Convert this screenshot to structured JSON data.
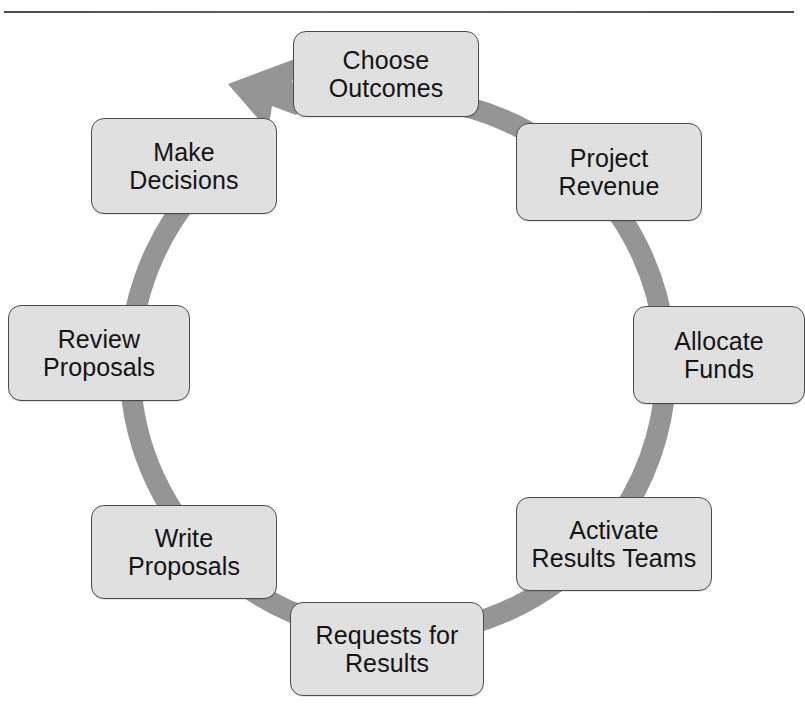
{
  "page": {
    "caption_remnant": "Figure 2. The Budgeting-for-Outcomes Cycle",
    "rule": "horizontal-rule"
  },
  "diagram": {
    "type": "cycle",
    "direction": "clockwise",
    "ring_color": "#9a9a9a",
    "node_fill": "#e3e3e3",
    "node_border": "#4b4b4b",
    "text_color": "#141414",
    "arrow": {
      "name": "clockwise-arrowhead",
      "points_to": "Choose Outcomes",
      "position": "upper-left"
    },
    "nodes": [
      {
        "id": "choose-outcomes",
        "label": "Choose\nOutcomes",
        "order": 1,
        "angle_deg": 0
      },
      {
        "id": "project-revenue",
        "label": "Project\nRevenue",
        "order": 2,
        "angle_deg": 45
      },
      {
        "id": "allocate-funds",
        "label": "Allocate\nFunds",
        "order": 3,
        "angle_deg": 90
      },
      {
        "id": "activate-results",
        "label": "Activate\nResults Teams",
        "order": 4,
        "angle_deg": 135
      },
      {
        "id": "requests-results",
        "label": "Requests for\nResults",
        "order": 5,
        "angle_deg": 180
      },
      {
        "id": "write-proposals",
        "label": "Write\nProposals",
        "order": 6,
        "angle_deg": 225
      },
      {
        "id": "review-proposals",
        "label": "Review\nProposals",
        "order": 7,
        "angle_deg": 270
      },
      {
        "id": "make-decisions",
        "label": "Make\nDecisions",
        "order": 8,
        "angle_deg": 315
      }
    ]
  }
}
